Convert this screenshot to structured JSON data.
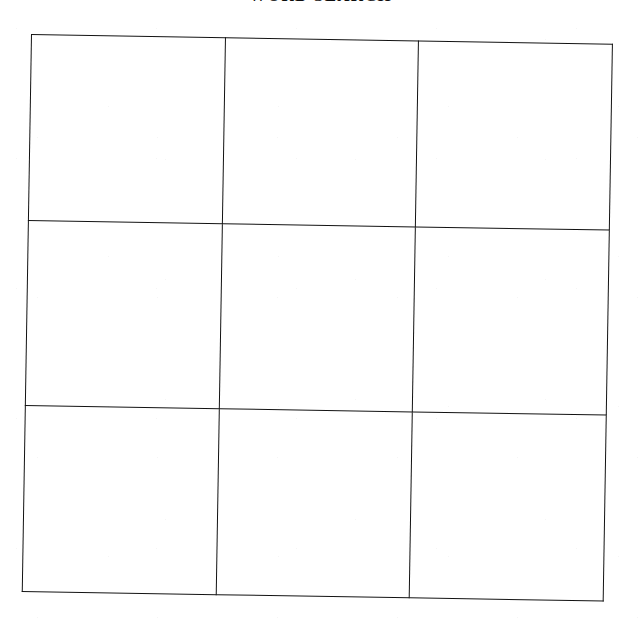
{
  "document": {
    "kind": "scanned-worksheet",
    "title": "WORD SEARCH",
    "title_note": "clipped-at-top-edge",
    "background_color": "#ffffff",
    "ink_color": "#131313",
    "skew_degrees": 0.95
  },
  "grid": {
    "name": "blank-3x3-grid",
    "rows": 3,
    "columns": 3,
    "border_color": "#131313",
    "border_width_px": 1.6,
    "cell_fill": "#ffffff",
    "cells": [
      [
        "",
        "",
        ""
      ],
      [
        "",
        "",
        ""
      ],
      [
        "",
        "",
        ""
      ]
    ],
    "row_labels": [
      "row-1",
      "row-2",
      "row-3"
    ],
    "column_labels": [
      "col-1",
      "col-2",
      "col-3"
    ]
  }
}
